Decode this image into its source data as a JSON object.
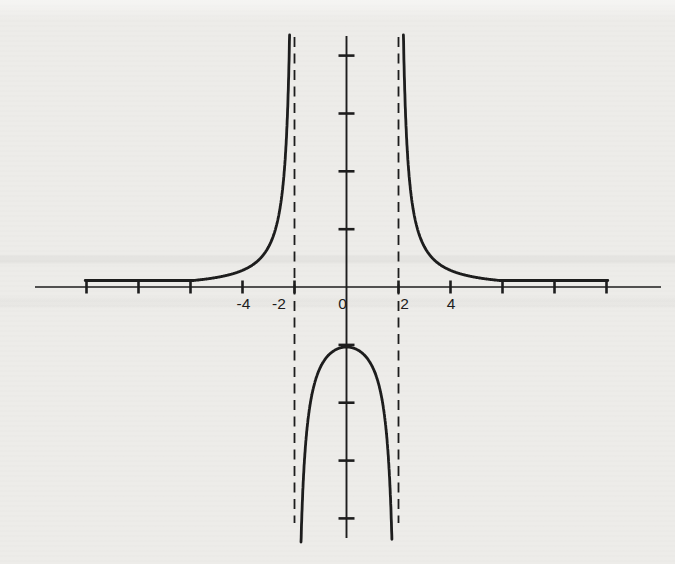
{
  "figure": {
    "kind": "scanned textbook function graph",
    "background_color": "#edece9",
    "ink_color": "#1d1d1d",
    "title": ""
  },
  "chart_data": {
    "type": "line",
    "title": "",
    "xlabel": "",
    "ylabel": "",
    "function": "y = 4 / (x^2 - 4)",
    "vertical_asymptotes": [
      -2,
      2
    ],
    "horizontal_asymptote_y": 0,
    "key_points": [
      {
        "x": 0,
        "y": -1,
        "note": "maximum of middle branch"
      }
    ],
    "branches": [
      {
        "name": "left",
        "x_range": [
          -10,
          -2
        ],
        "behavior": "y -> 0+ as x -> -inf, y -> +inf as x -> -2-"
      },
      {
        "name": "middle",
        "x_range": [
          -2,
          2
        ],
        "behavior": "y -> -inf at both asymptotes, max (0,-1)"
      },
      {
        "name": "right",
        "x_range": [
          2,
          10
        ],
        "behavior": "y -> +inf as x -> 2+, y -> 0+ as x -> +inf"
      }
    ],
    "x_axis": {
      "tick_min": -10,
      "tick_max": 10,
      "tick_step": 2,
      "labels": [
        {
          "value": -4,
          "text": "-4"
        },
        {
          "value": -2,
          "text": "-2"
        },
        {
          "value": 0,
          "text": "0"
        },
        {
          "value": 2,
          "text": "2"
        },
        {
          "value": 4,
          "text": "4"
        }
      ]
    },
    "y_axis": {
      "tick_min": -4,
      "tick_max": 4,
      "tick_step": 1,
      "labels": []
    },
    "grid": false,
    "legend": false
  },
  "layout_hints": {
    "canvas": [
      675,
      564
    ],
    "origin_px": [
      346.5,
      287
    ],
    "x_unit_px": 26,
    "y_unit_px": 57.85,
    "x_axis_px": [
      35,
      661
    ],
    "y_axis_px": [
      36,
      538
    ],
    "x_tick_half_len": 6.5,
    "y_tick_half_len": 8,
    "asymptote_top_px": 37,
    "asymptote_bottom_px": 523,
    "dash_pattern": "10 6.5",
    "curve_top_px": 35,
    "curve_bottom_px": 542,
    "outer_k_px": 200,
    "middle_k_px": 240,
    "tail_min_px": 6.5,
    "x_max_units": 10.05,
    "label_baseline_px": 309,
    "label_font_px": 15.5,
    "label_dx": {
      "-4": 1,
      "-2": -15.5,
      "0": -4,
      "2": 6,
      "4": 0.5
    },
    "stroke": {
      "axis": 1.7,
      "yaxis": 1.9,
      "tick": 2.6,
      "dash": 1.8,
      "curve": 2.8
    }
  }
}
